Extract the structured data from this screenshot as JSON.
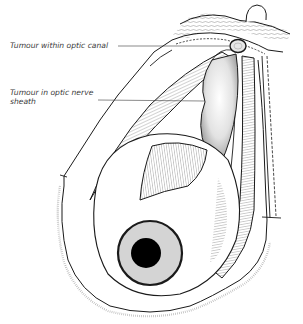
{
  "figure": {
    "labels": [
      {
        "text": "Tumour within optic canal"
      },
      {
        "text": "Tumour in optic nerve sheath"
      }
    ],
    "colors": {
      "line": "#1a1a1a",
      "iris": "#d4d4d4",
      "pupil": "#000000",
      "hatch": "#555555",
      "label_text": "#3a3a3a"
    }
  }
}
